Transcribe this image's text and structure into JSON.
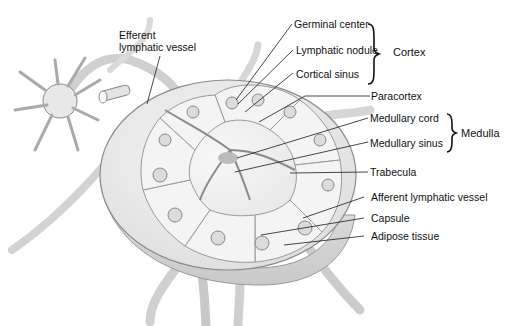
{
  "figure": {
    "colors": {
      "background": "#ffffff",
      "tissue_fill": "#efefef",
      "tissue_stroke": "#8a8a8a",
      "vessel_fill": "#e6e6e6",
      "leader_line": "#1a1a1a",
      "text": "#111111"
    }
  },
  "labels": {
    "efferent_line1": "Efferent",
    "efferent_line2": "lymphatic vessel",
    "germinal_center": "Germinal center",
    "lymphatic_nodule": "Lymphatic nodule",
    "cortical_sinus": "Cortical sinus",
    "paracortex": "Paracortex",
    "medullary_cord": "Medullary cord",
    "medullary_sinus": "Medullary sinus",
    "trabecula": "Trabecula",
    "afferent_vessel": "Afferent lymphatic vessel",
    "capsule": "Capsule",
    "adipose_tissue": "Adipose tissue"
  },
  "groups": {
    "cortex": "Cortex",
    "medulla": "Medulla"
  }
}
